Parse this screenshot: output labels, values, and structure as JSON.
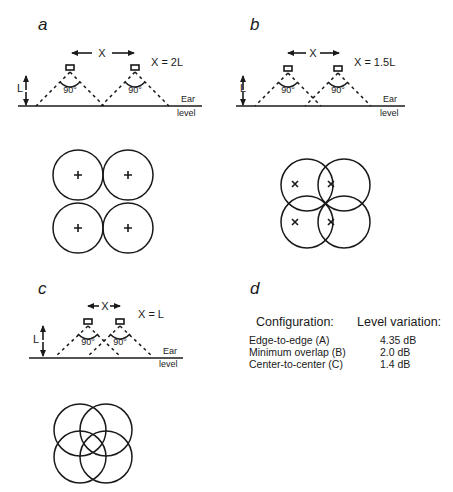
{
  "figure": {
    "panels": {
      "a": {
        "letter": "a",
        "spacing_label": "X",
        "spacing_equation": "X = 2L",
        "height_label": "L",
        "angle_labels": [
          "90°",
          "90°"
        ],
        "ground_label_1": "Ear",
        "ground_label_2": "level",
        "coverage_pattern": "edge-to-edge circles, centers marked with +"
      },
      "b": {
        "letter": "b",
        "spacing_label": "X",
        "spacing_equation": "X = 1.5L",
        "height_label": "L",
        "angle_labels": [
          "90°",
          "90°"
        ],
        "ground_label_1": "Ear",
        "ground_label_2": "level",
        "coverage_pattern": "minimum overlap circles, centers marked with ×"
      },
      "c": {
        "letter": "c",
        "spacing_label": "X",
        "spacing_equation": "X = L",
        "height_label": "L",
        "angle_labels": [
          "90°",
          "90°"
        ],
        "ground_label_1": "Ear",
        "ground_label_2": "level",
        "coverage_pattern": "center-to-center overlapping circles"
      },
      "d": {
        "letter": "d",
        "table": {
          "headers": [
            "Configuration:",
            "Level variation:"
          ],
          "rows": [
            {
              "configuration": "Edge-to-edge (A)",
              "level_variation": "4.35 dB"
            },
            {
              "configuration": "Minimum overlap (B)",
              "level_variation": "2.0 dB"
            },
            {
              "configuration": "Center-to-center (C)",
              "level_variation": "1.4 dB"
            }
          ]
        }
      }
    }
  }
}
